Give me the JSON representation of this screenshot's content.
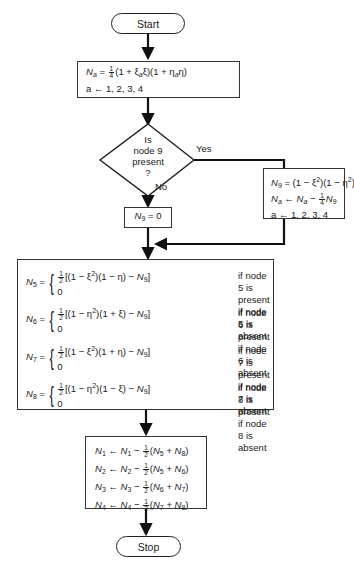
{
  "flowchart": {
    "start": {
      "label": "Start"
    },
    "stop": {
      "label": "Stop"
    },
    "init_box": {
      "line1": {
        "lhs": "N",
        "lhs_sub": "a",
        "eq": " = ",
        "frac": [
          "1",
          "4"
        ],
        "rhs": "(1 + ξ",
        "rhs_sub1": "a",
        "rhs_mid": "ξ)(1 + η",
        "rhs_sub2": "a",
        "rhs_end": "η)"
      },
      "line2": "a ← 1, 2, 3, 4"
    },
    "decision": {
      "lines": [
        "Is",
        "node 9",
        "present",
        "?"
      ],
      "yes_label": "Yes",
      "no_label": "No"
    },
    "yes_box": {
      "line1": {
        "lhs": "N",
        "lhs_sub": "9",
        "rhs": " = (1 − ξ",
        "sup1": "2",
        "mid": ")(1 − η",
        "sup2": "2",
        "end": ")"
      },
      "line2": {
        "lhs": "N",
        "lhs_sub": "a",
        "arrow": " ← ",
        "n": "N",
        "n_sub": "a",
        "minus": " − ",
        "frac": [
          "1",
          "4"
        ],
        "n9": "N",
        "n9_sub": "9"
      },
      "line3": "a ← 1, 2, 3, 4"
    },
    "no_box": {
      "lhs": "N",
      "lhs_sub": "9",
      "rhs": " = 0"
    },
    "mid_nodes": [
      {
        "node": "5",
        "lhs_sub": "5",
        "expr_a": "[(1 − ξ",
        "expr_b": ")(1 − η) − ",
        "zero": "0",
        "present": "if node 5 is present",
        "absent": "if node 5 is absent"
      },
      {
        "node": "6",
        "lhs_sub": "6",
        "expr_a": "[(1 − η",
        "expr_b": ")(1 + ξ) − ",
        "zero": "0",
        "present": "if node 6 is present",
        "absent": "if node 6 is absent"
      },
      {
        "node": "7",
        "lhs_sub": "7",
        "expr_a": "[(1 − ξ",
        "expr_b": ")(1 + η) − ",
        "zero": "0",
        "present": "if node 7 is present",
        "absent": "if node 7 is absent"
      },
      {
        "node": "8",
        "lhs_sub": "8",
        "expr_a": "[(1 − η",
        "expr_b": ")(1 − ξ) − ",
        "zero": "0",
        "present": "if node 8 is present",
        "absent": "if node 8 is absent"
      }
    ],
    "corner_box": [
      {
        "i": "1",
        "a": "5",
        "b": "8"
      },
      {
        "i": "2",
        "a": "5",
        "b": "6"
      },
      {
        "i": "3",
        "a": "6",
        "b": "7"
      },
      {
        "i": "4",
        "a": "7",
        "b": "8"
      }
    ],
    "symbols": {
      "N": "N",
      "eq": " = ",
      "arrow": " ← ",
      "minus": " − ",
      "plus": " + ",
      "half": [
        "1",
        "2"
      ],
      "N9": "N",
      "nine": "9",
      "sq": "2",
      "close": "]",
      "lp": "(",
      "rp": ")"
    }
  }
}
